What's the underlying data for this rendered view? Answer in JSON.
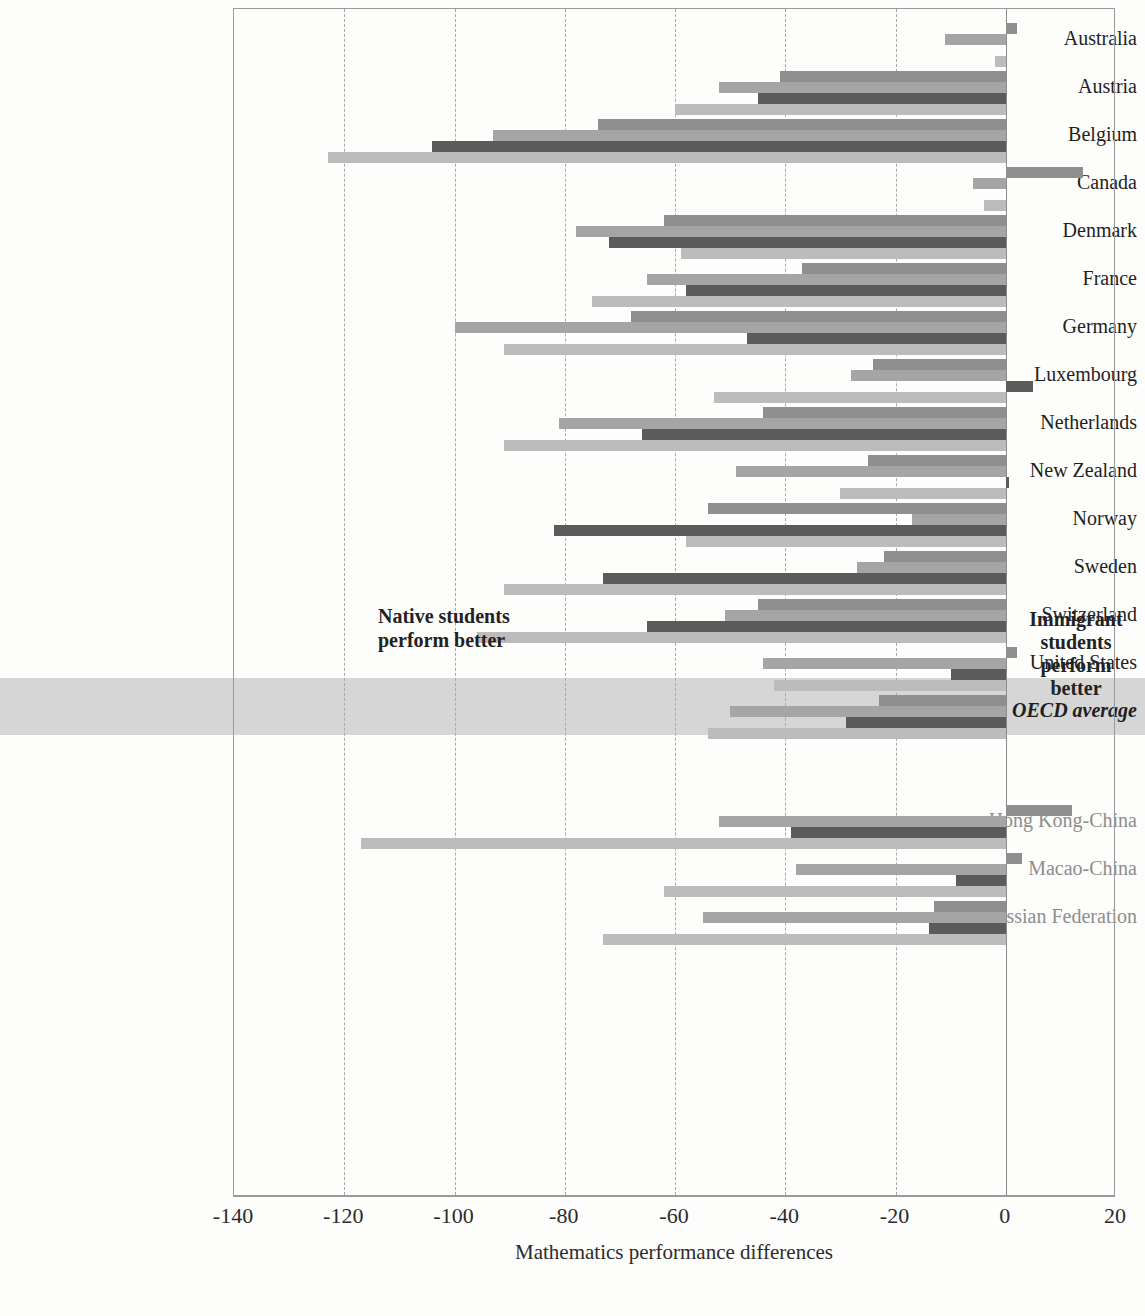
{
  "chart_data": {
    "type": "bar",
    "orientation": "horizontal",
    "title": "",
    "xlabel": "Mathematics performance differences",
    "ylabel": "",
    "xlim": [
      -140,
      20
    ],
    "xticks": [
      -140,
      -120,
      -100,
      -80,
      -60,
      -40,
      -20,
      0,
      20
    ],
    "xticklabels": [
      "-140",
      "-120",
      "-100",
      "-80",
      "-60",
      "-40",
      "-20",
      "0",
      "20"
    ],
    "grid": true,
    "grid_axis": "x",
    "legend": false,
    "annotations": [
      {
        "name": "native-note",
        "text_lines": [
          "Native students",
          "perform better"
        ],
        "x": -100,
        "side": "left"
      },
      {
        "name": "immigrant-note",
        "text_lines": [
          "Immigrant",
          "students",
          "perform",
          "better"
        ],
        "x": 10,
        "side": "right"
      }
    ],
    "series_colors": [
      "#8f8f8f",
      "#a5a5a5",
      "#5b5b5b",
      "#bcbcbc"
    ],
    "categories": [
      "Australia",
      "Austria",
      "Belgium",
      "Canada",
      "Denmark",
      "France",
      "Germany",
      "Luxembourg",
      "Netherlands",
      "New Zealand",
      "Norway",
      "Sweden",
      "Switzerland",
      "United States",
      "OECD average",
      "Hong Kong-China",
      "Macao-China",
      "Russian Federation"
    ],
    "highlight_category": "OECD average",
    "partner_categories": [
      "Hong Kong-China",
      "Macao-China",
      "Russian Federation"
    ],
    "rows": [
      {
        "category": "Australia",
        "values": [
          2,
          -11,
          null,
          -2
        ]
      },
      {
        "category": "Austria",
        "values": [
          -41,
          -52,
          -45,
          -60
        ]
      },
      {
        "category": "Belgium",
        "values": [
          -74,
          -93,
          -104,
          -123
        ]
      },
      {
        "category": "Canada",
        "values": [
          14,
          -6,
          null,
          -4
        ]
      },
      {
        "category": "Denmark",
        "values": [
          -62,
          -78,
          -72,
          -59
        ]
      },
      {
        "category": "France",
        "values": [
          -37,
          -65,
          -58,
          -75
        ]
      },
      {
        "category": "Germany",
        "values": [
          -68,
          -100,
          -47,
          -91
        ]
      },
      {
        "category": "Luxembourg",
        "values": [
          -24,
          -28,
          5,
          -53
        ]
      },
      {
        "category": "Netherlands",
        "values": [
          -44,
          -81,
          -66,
          -91
        ]
      },
      {
        "category": "New Zealand",
        "values": [
          -25,
          -49,
          0,
          -30
        ]
      },
      {
        "category": "Norway",
        "values": [
          -54,
          -17,
          -82,
          -58
        ]
      },
      {
        "category": "Sweden",
        "values": [
          -22,
          -27,
          -73,
          -91
        ]
      },
      {
        "category": "Switzerland",
        "values": [
          -45,
          -51,
          -65,
          -96
        ]
      },
      {
        "category": "United States",
        "values": [
          2,
          -44,
          -10,
          -42
        ]
      },
      {
        "category": "OECD average",
        "values": [
          -23,
          -50,
          -29,
          -54
        ]
      },
      {
        "category": "Hong Kong-China",
        "values": [
          12,
          -52,
          -39,
          -117
        ]
      },
      {
        "category": "Macao-China",
        "values": [
          3,
          -38,
          -9,
          -62
        ]
      },
      {
        "category": "Russian Federation",
        "values": [
          -13,
          -55,
          -14,
          -73
        ]
      }
    ]
  },
  "axis": {
    "xtitle": "Mathematics performance differences",
    "ticks": [
      "-140",
      "-120",
      "-100",
      "-80",
      "-60",
      "-40",
      "-20",
      "0",
      "20"
    ]
  },
  "annotations": {
    "native": [
      "Native students",
      "perform better"
    ],
    "immigrant": [
      "Immigrant",
      "students",
      "perform",
      "better"
    ]
  }
}
